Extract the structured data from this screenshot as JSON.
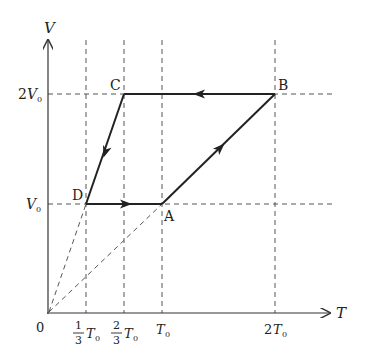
{
  "axes": {
    "x_label": "T",
    "y_label": "V",
    "origin_label": "0",
    "x_ticks": [
      {
        "num": "1",
        "den": "3",
        "sym": "T",
        "sub": "0"
      },
      {
        "num": "2",
        "den": "3",
        "sym": "T",
        "sub": "0"
      },
      {
        "sym": "T",
        "sub": "0"
      },
      {
        "coef": "2",
        "sym": "T",
        "sub": "0"
      }
    ],
    "y_ticks": [
      {
        "coef": "2",
        "sym": "V",
        "sub": "0"
      },
      {
        "sym": "V",
        "sub": "0"
      }
    ]
  },
  "points": {
    "A": {
      "label": "A",
      "T": "T0",
      "V": "V0"
    },
    "B": {
      "label": "B",
      "T": "2T0",
      "V": "2V0"
    },
    "C": {
      "label": "C",
      "T": "2/3 T0",
      "V": "2V0"
    },
    "D": {
      "label": "D",
      "T": "1/3 T0",
      "V": "V0"
    }
  },
  "processes": [
    {
      "from": "A",
      "to": "B",
      "type": "straight line, direction arrow toward B"
    },
    {
      "from": "B",
      "to": "C",
      "type": "isochoric-like horizontal at 2V0, arrow toward C"
    },
    {
      "from": "C",
      "to": "D",
      "type": "straight line, arrow toward D"
    },
    {
      "from": "D",
      "to": "A",
      "type": "horizontal at V0, arrow toward A"
    }
  ],
  "guides": {
    "origin_lines": [
      "0 to D (dashed)",
      "0 to A (dashed)"
    ]
  },
  "colors": {
    "line": "#222222",
    "dash": "#555555"
  }
}
